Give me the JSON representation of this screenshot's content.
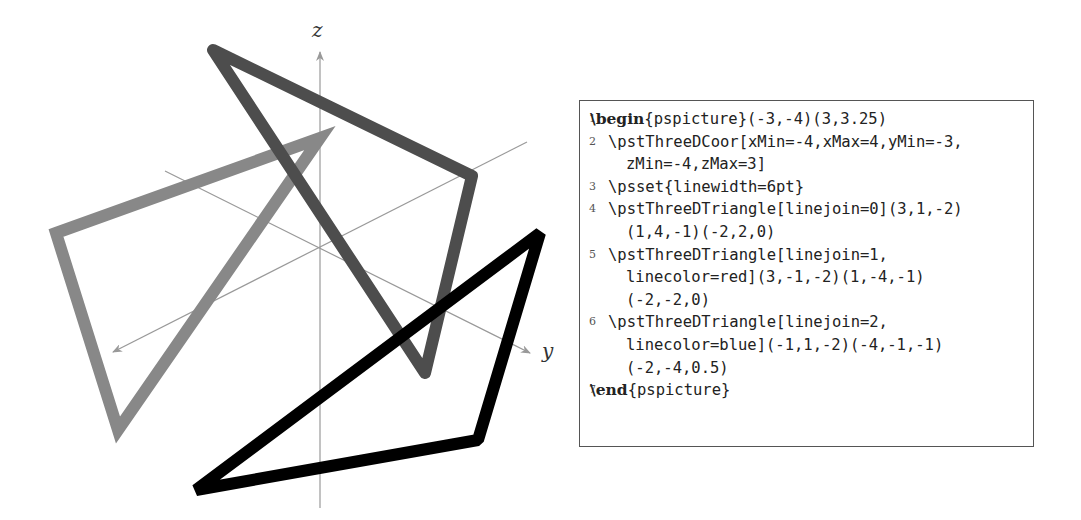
{
  "figure": {
    "axes": {
      "z_label": "z",
      "y_label": "y",
      "color": "#999999"
    },
    "triangles": [
      {
        "name": "triangle-linejoin-0",
        "linejoin": "miter",
        "color": "#888888",
        "points": [
          [
            56,
            233
          ],
          [
            320,
            138
          ],
          [
            118,
            430
          ]
        ]
      },
      {
        "name": "triangle-linejoin-1-red",
        "linejoin": "round",
        "color": "#4d4d4d",
        "points": [
          [
            213,
            50
          ],
          [
            472,
            176
          ],
          [
            425,
            373
          ]
        ]
      },
      {
        "name": "triangle-linejoin-2-blue",
        "linejoin": "bevel",
        "color": "#000000",
        "points": [
          [
            540,
            233
          ],
          [
            478,
            440
          ],
          [
            196,
            490
          ]
        ]
      }
    ]
  },
  "code": {
    "lines": [
      {
        "num": "1",
        "keyword": "\\begin",
        "text": "{pspicture}(-3,-4)(3,3.25)",
        "indent": 0
      },
      {
        "num": "2",
        "keyword": "",
        "text": "\\pstThreeDCoor[xMin=-4,xMax=4,yMin=-3,",
        "indent": 1
      },
      {
        "num": "",
        "keyword": "",
        "text": "zMin=-4,zMax=3]",
        "indent": 2
      },
      {
        "num": "3",
        "keyword": "",
        "text": "\\psset{linewidth=6pt}",
        "indent": 1
      },
      {
        "num": "4",
        "keyword": "",
        "text": "\\pstThreeDTriangle[linejoin=0](3,1,-2)",
        "indent": 1
      },
      {
        "num": "",
        "keyword": "",
        "text": "(1,4,-1)(-2,2,0)",
        "indent": 2
      },
      {
        "num": "5",
        "keyword": "",
        "text": "\\pstThreeDTriangle[linejoin=1,",
        "indent": 1
      },
      {
        "num": "",
        "keyword": "",
        "text": "linecolor=red](3,-1,-2)(1,-4,-1)",
        "indent": 2
      },
      {
        "num": "",
        "keyword": "",
        "text": "(-2,-2,0)",
        "indent": 2
      },
      {
        "num": "6",
        "keyword": "",
        "text": "\\pstThreeDTriangle[linejoin=2,",
        "indent": 1
      },
      {
        "num": "",
        "keyword": "",
        "text": "linecolor=blue](-1,1,-2)(-4,-1,-1)",
        "indent": 2
      },
      {
        "num": "",
        "keyword": "",
        "text": "(-2,-4,0.5)",
        "indent": 2
      },
      {
        "num": "7",
        "keyword": "\\end",
        "text": "{pspicture}",
        "indent": 0
      }
    ]
  }
}
